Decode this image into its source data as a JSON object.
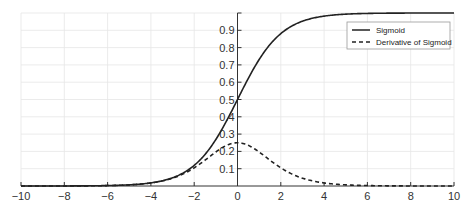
{
  "chart_data": {
    "type": "line",
    "title": "",
    "xlabel": "",
    "ylabel": "",
    "xlim": [
      -10,
      10
    ],
    "ylim": [
      0,
      1
    ],
    "grid": true,
    "legend_position": "upper right",
    "x_ticks": [
      -10,
      -8,
      -6,
      -4,
      -2,
      0,
      2,
      4,
      6,
      8,
      10
    ],
    "x_tick_labels": [
      "−10",
      "−8",
      "−6",
      "−4",
      "−2",
      "0",
      "2",
      "4",
      "6",
      "8",
      "10"
    ],
    "y_ticks": [
      0.1,
      0.2,
      0.3,
      0.4,
      0.5,
      0.6,
      0.7,
      0.8,
      0.9
    ],
    "y_tick_labels": [
      "0.1",
      "0.2",
      "0.3",
      "0.4",
      "0.5",
      "0.6",
      "0.7",
      "0.8",
      "0.9"
    ],
    "x": [
      -10,
      -8,
      -6,
      -5,
      -4,
      -3,
      -2,
      -1.5,
      -1,
      -0.5,
      0,
      0.5,
      1,
      1.5,
      2,
      3,
      4,
      5,
      6,
      8,
      10
    ],
    "series": [
      {
        "name": "Sigmoid",
        "style": "solid",
        "color": "#222222",
        "values": [
          0.0,
          0.0003,
          0.0025,
          0.0067,
          0.018,
          0.047,
          0.119,
          0.182,
          0.269,
          0.378,
          0.5,
          0.622,
          0.731,
          0.818,
          0.881,
          0.953,
          0.982,
          0.993,
          0.998,
          0.9997,
          1.0
        ]
      },
      {
        "name": "Derivative of Sigmoid",
        "style": "dashed",
        "color": "#222222",
        "values": [
          0.0,
          0.0003,
          0.0025,
          0.0066,
          0.018,
          0.045,
          0.105,
          0.149,
          0.197,
          0.235,
          0.25,
          0.235,
          0.197,
          0.149,
          0.105,
          0.045,
          0.018,
          0.0066,
          0.0025,
          0.0003,
          0.0
        ]
      }
    ]
  },
  "legend": {
    "items": [
      {
        "label": "Sigmoid",
        "style": "solid"
      },
      {
        "label": "Derivative of Sigmoid",
        "style": "dashed"
      }
    ]
  },
  "colors": {
    "line": "#222222",
    "grid": "#e6e6e6",
    "axis": "#333333",
    "legend_border": "#999999"
  }
}
